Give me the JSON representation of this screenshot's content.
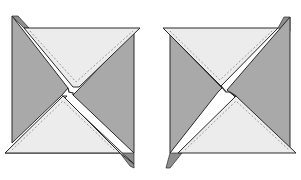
{
  "diagram": {
    "colors": {
      "dark": "#a9a9a9",
      "dark_edge": "#8e8e8e",
      "light": "#ececec",
      "outline": "#2a2a2a",
      "seam": "#777777",
      "background": "#ffffff"
    },
    "blocks": [
      {
        "id": "left-block",
        "orientation": "counter-clockwise"
      },
      {
        "id": "right-block",
        "orientation": "clockwise"
      }
    ]
  }
}
